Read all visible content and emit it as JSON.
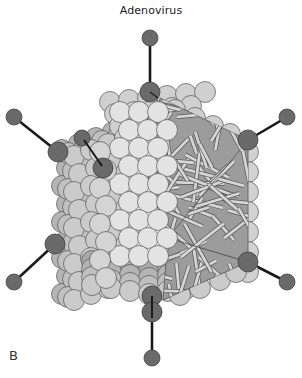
{
  "figure": {
    "title": "Adenovirus",
    "panel_label": "B"
  },
  "structure": {
    "capsid_shape": "icosahedron",
    "fiber_count": 6,
    "components": [
      "capsomere",
      "penton base",
      "fiber",
      "fiber knob",
      "nucleic acid core"
    ]
  },
  "colors": {
    "capsomere_light": "#e3e3e3",
    "capsomere_mid": "#c4c4c4",
    "capsomere_dark": "#a9a9a9",
    "penton": "#6a6a6a",
    "fiber": "#1a1a1a",
    "core_bg": "#9c9c9c",
    "core_strand": "#d6d6d6",
    "outline": "#555555"
  }
}
